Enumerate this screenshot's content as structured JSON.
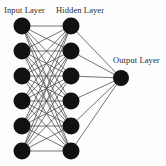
{
  "diagram": {
    "type": "feedforward-neural-network",
    "background_color": "#fdfdfd",
    "node_color": "#111111",
    "edge_color": "#3a3a3a",
    "label_color": "#2b2b2b"
  },
  "labels": {
    "input": "Input Layer",
    "hidden": "Hidden Layer",
    "output": "Output Layer"
  },
  "layers": [
    {
      "id": "input",
      "name": "Input Layer",
      "node_count": 6,
      "x": 22,
      "node_radius": 8.5,
      "nodes_y": [
        26,
        51,
        76,
        101,
        126,
        151
      ]
    },
    {
      "id": "hidden",
      "name": "Hidden Layer",
      "node_count": 6,
      "x": 71,
      "node_radius": 8.5,
      "nodes_y": [
        26,
        51,
        76,
        101,
        126,
        151
      ]
    },
    {
      "id": "output",
      "name": "Output Layer",
      "node_count": 1,
      "x": 121,
      "node_radius": 8.0,
      "nodes_y": [
        78
      ]
    }
  ],
  "connections": {
    "input_to_hidden": "fully-connected",
    "input_to_hidden_count": 36,
    "hidden_to_output": "fully-connected",
    "hidden_to_output_count": 6,
    "edge_width": 0.7
  }
}
